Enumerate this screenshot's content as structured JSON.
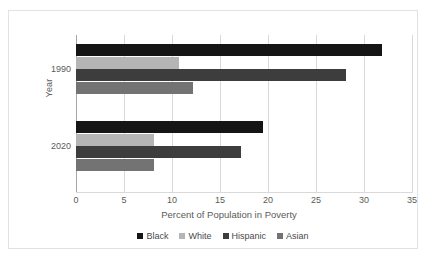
{
  "chart_data": {
    "type": "bar",
    "orientation": "horizontal",
    "title": "",
    "xlabel": "Percent of Population in Poverty",
    "ylabel": "Year",
    "categories": [
      "1990",
      "2020"
    ],
    "xlim": [
      0,
      35
    ],
    "xticks": [
      "0",
      "5",
      "10",
      "15",
      "20",
      "25",
      "30",
      "35"
    ],
    "grid": true,
    "legend_position": "bottom",
    "series": [
      {
        "name": "Black",
        "color": "#151515",
        "values": [
          31.9,
          19.5
        ]
      },
      {
        "name": "White",
        "color": "#b5b5b5",
        "values": [
          10.7,
          8.1
        ]
      },
      {
        "name": "Hispanic",
        "color": "#3d3d3d",
        "values": [
          28.1,
          17.2
        ]
      },
      {
        "name": "Asian",
        "color": "#737373",
        "values": [
          12.2,
          8.1
        ]
      }
    ]
  }
}
